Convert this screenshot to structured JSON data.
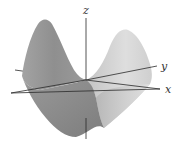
{
  "diagram": {
    "axes": {
      "x": {
        "label": "x"
      },
      "y": {
        "label": "y"
      },
      "z": {
        "label": "z"
      }
    },
    "colors": {
      "background": "#ffffff",
      "axis": "#2a2a2a",
      "surface_dark": "#8a8a8a",
      "surface_mid": "#a6a6a6",
      "surface_light": "#d9d9d9"
    }
  }
}
